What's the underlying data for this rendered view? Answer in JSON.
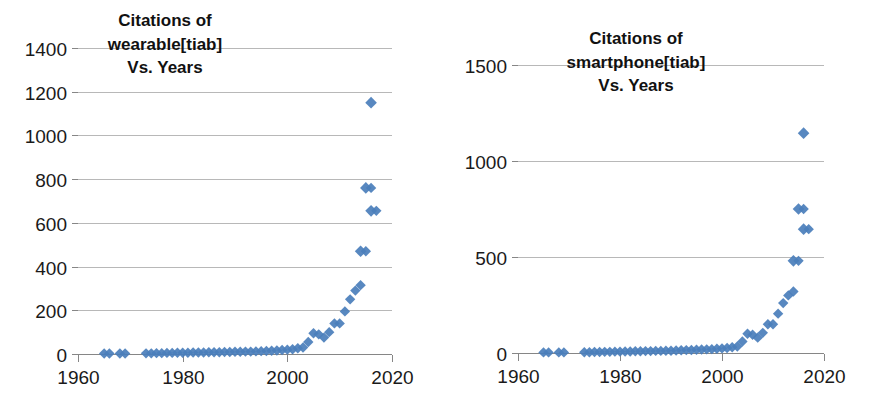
{
  "figure": {
    "background_color": "#ffffff",
    "marker_color": "#4a7ebb",
    "gridline_color": "#b8b8b8",
    "axis_color": "#868686",
    "text_color": "#111111"
  },
  "panels": [
    {
      "id": "left",
      "title_lines": [
        "Citations of",
        "wearable[tiab]",
        "Vs. Years"
      ],
      "chart_data": {
        "type": "scatter",
        "title": "Citations of wearable[tiab] Vs. Years",
        "xlabel": "",
        "ylabel": "",
        "xlim": [
          1960,
          2020
        ],
        "ylim": [
          0,
          1400
        ],
        "xticks": [
          1960,
          1980,
          2000,
          2020
        ],
        "yticks": [
          0,
          200,
          400,
          600,
          800,
          1000,
          1200,
          1400
        ],
        "grid": true,
        "legend": "none",
        "series": [
          {
            "name": "Citations of wearable[tiab]",
            "marker": "diamond",
            "color": "#4a7ebb",
            "x": [
              1965,
              1966,
              1968,
              1969,
              1973,
              1974,
              1975,
              1976,
              1977,
              1978,
              1979,
              1980,
              1981,
              1982,
              1983,
              1984,
              1985,
              1986,
              1987,
              1988,
              1989,
              1990,
              1991,
              1992,
              1993,
              1994,
              1995,
              1996,
              1997,
              1998,
              1999,
              2000,
              2001,
              2002,
              2003,
              2004,
              2005,
              2006,
              2007,
              2008,
              2009,
              2010,
              2011,
              2012,
              2013,
              2014,
              2015,
              2016,
              2017
            ],
            "y": [
              2,
              2,
              2,
              2,
              3,
              3,
              4,
              4,
              5,
              5,
              6,
              6,
              6,
              7,
              7,
              7,
              8,
              8,
              8,
              9,
              9,
              10,
              10,
              11,
              11,
              12,
              13,
              14,
              15,
              16,
              18,
              20,
              22,
              26,
              30,
              55,
              95,
              90,
              75,
              100,
              140,
              140,
              195,
              250,
              290,
              315,
              470,
              760,
              655
            ],
            "outliers": [
              {
                "x": 2016,
                "y": 1150
              },
              {
                "x": 2015,
                "y": 760
              },
              {
                "x": 2016,
                "y": 655
              },
              {
                "x": 2014,
                "y": 470
              }
            ]
          }
        ]
      }
    },
    {
      "id": "right",
      "title_lines": [
        "Citations of",
        "smartphone[tiab]",
        "Vs. Years"
      ],
      "chart_data": {
        "type": "scatter",
        "title": "Citations of smartphone[tiab] Vs. Years",
        "xlabel": "",
        "ylabel": "",
        "xlim": [
          1960,
          2020
        ],
        "ylim": [
          0,
          1500
        ],
        "xticks": [
          1960,
          1980,
          2000,
          2020
        ],
        "yticks": [
          0,
          500,
          1000,
          1500
        ],
        "grid": true,
        "legend": "none",
        "series": [
          {
            "name": "Citations of smartphone[tiab]",
            "marker": "diamond",
            "color": "#4a7ebb",
            "x": [
              1965,
              1966,
              1968,
              1969,
              1973,
              1974,
              1975,
              1976,
              1977,
              1978,
              1979,
              1980,
              1981,
              1982,
              1983,
              1984,
              1985,
              1986,
              1987,
              1988,
              1989,
              1990,
              1991,
              1992,
              1993,
              1994,
              1995,
              1996,
              1997,
              1998,
              1999,
              2000,
              2001,
              2002,
              2003,
              2004,
              2005,
              2006,
              2007,
              2008,
              2009,
              2010,
              2011,
              2012,
              2013,
              2014,
              2015,
              2016,
              2017
            ],
            "y": [
              3,
              3,
              3,
              3,
              4,
              4,
              5,
              5,
              6,
              6,
              7,
              7,
              8,
              8,
              9,
              9,
              10,
              10,
              11,
              11,
              12,
              12,
              13,
              14,
              15,
              16,
              17,
              18,
              19,
              20,
              22,
              24,
              26,
              30,
              34,
              60,
              100,
              95,
              80,
              105,
              150,
              150,
              205,
              260,
              300,
              320,
              480,
              750,
              645
            ],
            "outliers": [
              {
                "x": 2016,
                "y": 1145
              },
              {
                "x": 2015,
                "y": 750
              },
              {
                "x": 2016,
                "y": 645
              },
              {
                "x": 2014,
                "y": 480
              }
            ]
          }
        ]
      }
    }
  ]
}
